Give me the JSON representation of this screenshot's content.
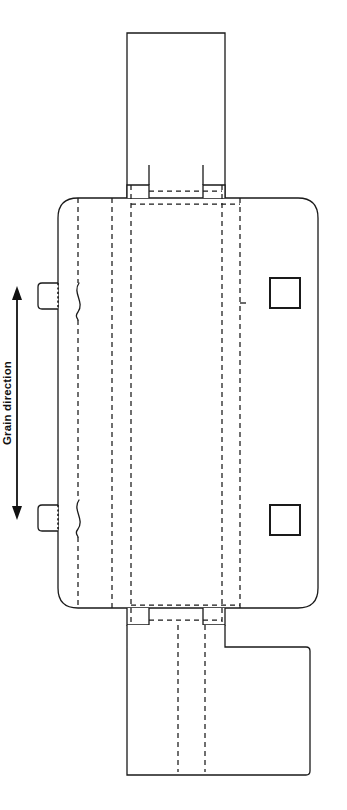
{
  "drawing": {
    "title": "Carton Dieline / Packaging Blank",
    "type": "technical-line-drawing",
    "canvas": {
      "width": 347,
      "height": 810,
      "background": "#ffffff"
    }
  },
  "annotations": {
    "grain_direction_label": "Grain direction"
  },
  "colors": {
    "cut_line": "#1a1a1a",
    "crease_line": "#1a1a1a",
    "perforation_line": "#1a1a1a",
    "annotation": "#111111",
    "paper": "#ffffff"
  },
  "line_types": [
    {
      "name": "cut-line",
      "style": "solid",
      "meaning": "cut / outer trim edge"
    },
    {
      "name": "crease-line",
      "style": "dashed",
      "meaning": "fold / score crease"
    },
    {
      "name": "perforation-line",
      "style": "dotted",
      "meaning": "perforation / tear"
    }
  ],
  "geometry": {
    "body_panel": {
      "x": 58,
      "y": 198,
      "width": 260,
      "height": 410,
      "corner_radius": 20
    },
    "top_flap": {
      "x": 127,
      "y": 33,
      "width": 98,
      "height": 165
    },
    "bottom_flap": {
      "x": 127,
      "y": 625,
      "width": 183,
      "height": 150,
      "notch_x": 222,
      "notch_y": 647
    },
    "top_tab_left": {
      "x": 127,
      "y": 185,
      "width": 22,
      "height": 13
    },
    "top_tab_right": {
      "x": 222,
      "y": 185,
      "width": 22,
      "height": 13
    },
    "bottom_tab_left": {
      "x": 127,
      "y": 608,
      "width": 22,
      "height": 17
    },
    "bottom_tab_right": {
      "x": 222,
      "y": 608,
      "width": 22,
      "height": 17
    },
    "vertical_creases_x": [
      78,
      112,
      131,
      222,
      240
    ],
    "horizontal_creases_top_y": [
      191,
      204
    ],
    "horizontal_creases_bottom_y": [
      605,
      620
    ],
    "side_tab_upper": {
      "x": 38,
      "y": 283,
      "width": 20,
      "height": 26
    },
    "side_tab_lower": {
      "x": 38,
      "y": 505,
      "width": 20,
      "height": 26
    },
    "side_tab_perf_x": 58,
    "nick_curve_upper": {
      "x": 78,
      "y_start": 283,
      "y_end": 320
    },
    "nick_curve_lower": {
      "x": 78,
      "y_start": 500,
      "y_end": 537
    },
    "cutout_square_upper": {
      "x": 270,
      "y": 278,
      "size": 30
    },
    "cutout_square_lower": {
      "x": 270,
      "y": 505,
      "size": 30
    },
    "grain_arrow": {
      "x": 17,
      "y_top": 288,
      "y_bottom": 518
    },
    "grain_text_y": 403
  }
}
